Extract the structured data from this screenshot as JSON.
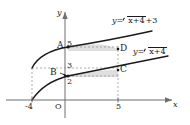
{
  "figure": {
    "axes": {
      "x_label": "x",
      "y_label": "y",
      "origin_label": "O",
      "x_ticks": [
        "-4",
        "5"
      ],
      "y_ticks": [
        "5",
        "3",
        "2"
      ]
    },
    "curves": [
      {
        "name": "upper-curve",
        "equation_parts": {
          "lhs": "y=",
          "radicand": "x+4",
          "tail": "+3"
        }
      },
      {
        "name": "lower-curve",
        "equation_parts": {
          "lhs": "y=",
          "radicand": "x+4",
          "tail": ""
        }
      }
    ],
    "points": [
      {
        "name": "A",
        "label": "A"
      },
      {
        "name": "B",
        "label": "B"
      },
      {
        "name": "C",
        "label": "C"
      },
      {
        "name": "D",
        "label": "D"
      }
    ],
    "colors": {
      "ink": "#1a1a1a",
      "axis": "#6f6f6f",
      "dashed": "#9a9a9a",
      "shade": "#d9d9d9"
    }
  }
}
